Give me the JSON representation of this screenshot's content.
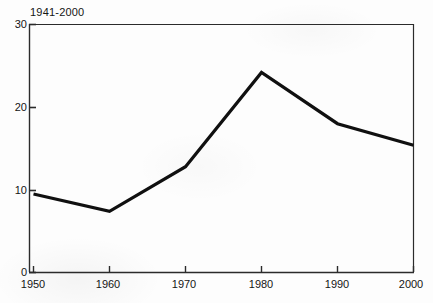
{
  "chart_data": {
    "type": "line",
    "title": "1941-2000",
    "xlabel": "",
    "ylabel": "",
    "x": [
      1950,
      1960,
      1970,
      1980,
      1990,
      2000
    ],
    "categories": [
      "1950",
      "1960",
      "1970",
      "1980",
      "1990",
      "2000"
    ],
    "values": [
      9.5,
      7.4,
      12.8,
      24.2,
      18.0,
      15.4
    ],
    "series": [
      {
        "name": "1941-2000",
        "values": [
          9.5,
          7.4,
          12.8,
          24.2,
          18.0,
          15.4
        ]
      }
    ],
    "xlim": [
      1950,
      2000
    ],
    "ylim": [
      0,
      30
    ],
    "xticks": [
      "1950",
      "1960",
      "1970",
      "1980",
      "1990",
      "2000"
    ],
    "yticks": [
      "0",
      "10",
      "20",
      "30"
    ],
    "ytick_values": [
      0,
      10,
      20,
      30
    ],
    "grid": false,
    "legend": false,
    "legend_position": "none",
    "line_color": "#101010",
    "line_width": 3.2,
    "axis_color": "#2b2b2b",
    "background_color": "#ffffff",
    "frame": "box"
  }
}
